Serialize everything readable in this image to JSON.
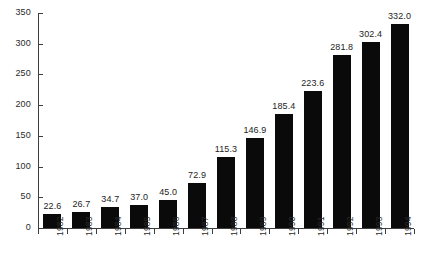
{
  "chart_data": {
    "type": "bar",
    "title": "",
    "subtitle": "",
    "xlabel": "",
    "ylabel": "",
    "categories": [
      "1982",
      "1983",
      "1984",
      "1985",
      "1986",
      "1987",
      "1988",
      "1989",
      "1990",
      "1991",
      "1992",
      "1993",
      "1994"
    ],
    "values": [
      22.6,
      26.7,
      34.7,
      37.0,
      45.0,
      72.9,
      115.3,
      146.9,
      185.4,
      223.6,
      281.8,
      302.4,
      332.0
    ],
    "value_labels": [
      "22.6",
      "26.7",
      "34.7",
      "37.0",
      "45.0",
      "72.9",
      "115.3",
      "146.9",
      "185.4",
      "223.6",
      "281.8",
      "302.4",
      "332.0"
    ],
    "ylim": [
      0,
      350
    ],
    "yticks": [
      0,
      50,
      100,
      150,
      200,
      250,
      300,
      350
    ],
    "ytick_labels": [
      "0",
      "50",
      "100",
      "150",
      "200",
      "250",
      "300",
      "350"
    ],
    "grid": false,
    "legend": null,
    "legend_position": "none",
    "bar_color": "#0a0a0a",
    "axis_color": "#3d3d3d",
    "text_color": "#1d1d1d",
    "background_color": "#ffffff",
    "xtick_label_rotation": 90
  }
}
